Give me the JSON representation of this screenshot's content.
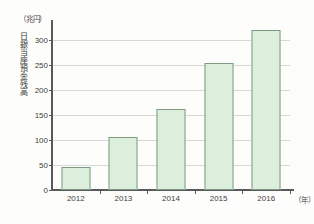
{
  "chart_data": {
    "type": "bar",
    "title": "",
    "subtitle": "",
    "xlabel": "（年）",
    "ylabel": "日銀当座預金残高",
    "yunit": "（兆円）",
    "categories": [
      "2012",
      "2013",
      "2014",
      "2015",
      "2016"
    ],
    "values": [
      46,
      107,
      163,
      255,
      320
    ],
    "series": [
      {
        "name": "日銀当座預金残高",
        "values": [
          46,
          107,
          163,
          255,
          320
        ]
      }
    ],
    "ylim": [
      0,
      330
    ],
    "yticks": [
      0,
      50,
      100,
      150,
      200,
      250,
      300
    ],
    "ytick_labels": [
      "0",
      "50",
      "100",
      "150",
      "200",
      "250",
      "300"
    ],
    "grid": true,
    "legend": false,
    "legend_position": "none",
    "bar_color": "#dcefdc",
    "bar_border_color": "#7f9a80",
    "gridline_color": "#d8d8d8",
    "axis_color": "#5a5a5a",
    "background_color": "#fdfdfb"
  }
}
